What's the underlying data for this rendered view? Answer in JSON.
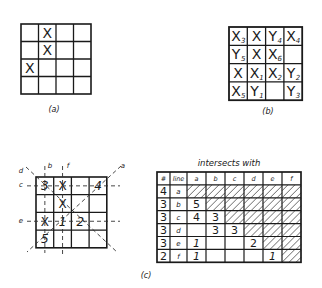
{
  "figure": {
    "panel_a": {
      "caption": "(a)",
      "grid_size": 4,
      "marks": [
        {
          "row": 0,
          "col": 1,
          "label": "X"
        },
        {
          "row": 1,
          "col": 1,
          "label": "X"
        },
        {
          "row": 2,
          "col": 0,
          "label": "X"
        }
      ]
    },
    "panel_b": {
      "caption": "(b)",
      "grid_size": 4,
      "cells": [
        [
          {
            "l": "X",
            "s": "3"
          },
          {
            "l": "X",
            "s": ""
          },
          {
            "l": "Y",
            "s": "4"
          },
          {
            "l": "X",
            "s": "4"
          }
        ],
        [
          {
            "l": "Y",
            "s": "5"
          },
          {
            "l": "X",
            "s": ""
          },
          {
            "l": "X",
            "s": "6"
          },
          {
            "l": "",
            "s": ""
          }
        ],
        [
          {
            "l": "X",
            "s": ""
          },
          {
            "l": "X",
            "s": "1"
          },
          {
            "l": "X",
            "s": "2"
          },
          {
            "l": "Y",
            "s": "2"
          }
        ],
        [
          {
            "l": "X",
            "s": "5"
          },
          {
            "l": "Y",
            "s": "1"
          },
          {
            "l": "",
            "s": ""
          },
          {
            "l": "Y",
            "s": "3"
          }
        ]
      ]
    },
    "panel_c": {
      "caption": "(c)",
      "grid_size": 4,
      "cells": [
        [
          "3",
          "X",
          "",
          "4"
        ],
        [
          "",
          "X",
          "",
          ""
        ],
        [
          "X",
          "1",
          "2",
          ""
        ],
        [
          "5",
          "",
          "",
          ""
        ]
      ],
      "line_labels": {
        "a": "a",
        "b": "b",
        "c": "c",
        "d": "d",
        "e": "e",
        "f": "f"
      },
      "table": {
        "title": "intersects with",
        "headers": [
          "#",
          "line",
          "a",
          "b",
          "c",
          "d",
          "e",
          "f"
        ],
        "rows": [
          {
            "count": "4",
            "line": "a",
            "values": [
              "/",
              "/",
              "/",
              "/",
              "/",
              "/"
            ]
          },
          {
            "count": "3",
            "line": "b",
            "values": [
              "5",
              "/",
              "/",
              "/",
              "/",
              "/"
            ]
          },
          {
            "count": "3",
            "line": "c",
            "values": [
              "4",
              "3",
              "/",
              "/",
              "/",
              "/"
            ]
          },
          {
            "count": "3",
            "line": "d",
            "values": [
              "",
              "3",
              "3",
              "/",
              "/",
              "/"
            ]
          },
          {
            "count": "3",
            "line": "e",
            "values": [
              "1",
              "",
              "",
              "2",
              "/",
              "/"
            ]
          },
          {
            "count": "2",
            "line": "f",
            "values": [
              "1",
              "",
              "",
              "",
              "1",
              "/"
            ]
          }
        ]
      }
    }
  }
}
